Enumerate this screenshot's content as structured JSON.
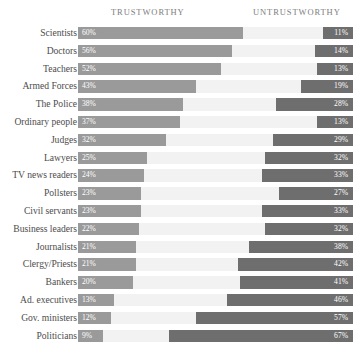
{
  "chart_data": {
    "type": "bar",
    "title": "",
    "subtitle": "",
    "xlabel": "",
    "ylabel": "",
    "orientation": "horizontal",
    "layout": "diverging-shared-track",
    "grid": false,
    "axis_range": [
      0,
      100
    ],
    "value_suffix": "%",
    "legend_position": "top",
    "headers": {
      "left": "TRUSTWORTHY",
      "right": "UNTRUSTWORTHY"
    },
    "categories": [
      "Scientists",
      "Doctors",
      "Teachers",
      "Armed Forces",
      "The Police",
      "Ordinary people",
      "Judges",
      "Lawyers",
      "TV news readers",
      "Pollsters",
      "Civil servants",
      "Business leaders",
      "Journalists",
      "Clergy/Priests",
      "Bankers",
      "Ad. executives",
      "Gov. ministers",
      "Politicians"
    ],
    "series": [
      {
        "name": "TRUSTWORTHY",
        "color": "#9a9a9a",
        "values": [
          60,
          56,
          52,
          43,
          38,
          37,
          32,
          25,
          24,
          23,
          23,
          22,
          21,
          21,
          20,
          13,
          12,
          9
        ]
      },
      {
        "name": "UNTRUSTWORTHY",
        "color": "#6e6e6e",
        "values": [
          11,
          14,
          13,
          19,
          28,
          13,
          29,
          32,
          33,
          27,
          33,
          32,
          38,
          42,
          41,
          46,
          57,
          67
        ]
      }
    ],
    "rows": [
      {
        "label": "Scientists",
        "trustworthy": 60,
        "untrustworthy": 11,
        "trustworthy_label": "60%",
        "untrustworthy_label": "11%"
      },
      {
        "label": "Doctors",
        "trustworthy": 56,
        "untrustworthy": 14,
        "trustworthy_label": "56%",
        "untrustworthy_label": "14%"
      },
      {
        "label": "Teachers",
        "trustworthy": 52,
        "untrustworthy": 13,
        "trustworthy_label": "52%",
        "untrustworthy_label": "13%"
      },
      {
        "label": "Armed Forces",
        "trustworthy": 43,
        "untrustworthy": 19,
        "trustworthy_label": "43%",
        "untrustworthy_label": "19%"
      },
      {
        "label": "The Police",
        "trustworthy": 38,
        "untrustworthy": 28,
        "trustworthy_label": "38%",
        "untrustworthy_label": "28%"
      },
      {
        "label": "Ordinary people",
        "trustworthy": 37,
        "untrustworthy": 13,
        "trustworthy_label": "37%",
        "untrustworthy_label": "13%"
      },
      {
        "label": "Judges",
        "trustworthy": 32,
        "untrustworthy": 29,
        "trustworthy_label": "32%",
        "untrustworthy_label": "29%"
      },
      {
        "label": "Lawyers",
        "trustworthy": 25,
        "untrustworthy": 32,
        "trustworthy_label": "25%",
        "untrustworthy_label": "32%"
      },
      {
        "label": "TV news readers",
        "trustworthy": 24,
        "untrustworthy": 33,
        "trustworthy_label": "24%",
        "untrustworthy_label": "33%"
      },
      {
        "label": "Pollsters",
        "trustworthy": 23,
        "untrustworthy": 27,
        "trustworthy_label": "23%",
        "untrustworthy_label": "27%"
      },
      {
        "label": "Civil servants",
        "trustworthy": 23,
        "untrustworthy": 33,
        "trustworthy_label": "23%",
        "untrustworthy_label": "33%"
      },
      {
        "label": "Business leaders",
        "trustworthy": 22,
        "untrustworthy": 32,
        "trustworthy_label": "22%",
        "untrustworthy_label": "32%"
      },
      {
        "label": "Journalists",
        "trustworthy": 21,
        "untrustworthy": 38,
        "trustworthy_label": "21%",
        "untrustworthy_label": "38%"
      },
      {
        "label": "Clergy/Priests",
        "trustworthy": 21,
        "untrustworthy": 42,
        "trustworthy_label": "21%",
        "untrustworthy_label": "42%"
      },
      {
        "label": "Bankers",
        "trustworthy": 20,
        "untrustworthy": 41,
        "trustworthy_label": "20%",
        "untrustworthy_label": "41%"
      },
      {
        "label": "Ad. executives",
        "trustworthy": 13,
        "untrustworthy": 46,
        "trustworthy_label": "13%",
        "untrustworthy_label": "46%"
      },
      {
        "label": "Gov. ministers",
        "trustworthy": 12,
        "untrustworthy": 57,
        "trustworthy_label": "12%",
        "untrustworthy_label": "57%"
      },
      {
        "label": "Politicians",
        "trustworthy": 9,
        "untrustworthy": 67,
        "trustworthy_label": "9%",
        "untrustworthy_label": "67%"
      }
    ],
    "colors": {
      "trustworthy_bar": "#9a9a9a",
      "untrustworthy_bar": "#6e6e6e",
      "track": "#f2f2f2",
      "background": "#ffffff",
      "label_text": "#4d4d4d",
      "header_text": "#7d7d7d",
      "value_text": "#ffffff"
    }
  }
}
